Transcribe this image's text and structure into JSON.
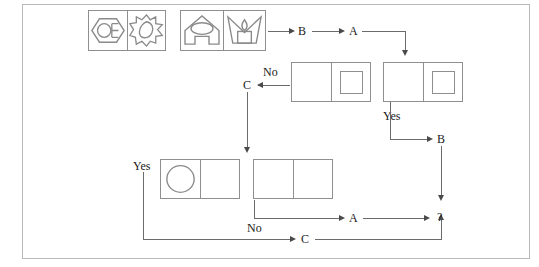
{
  "diagram": {
    "type": "flowchart",
    "title": "",
    "background_color": "#ffffff",
    "frame_color": "#b9b9b9",
    "line_color": "#6b6b6b",
    "shape_stroke_color": "#8a8a8a",
    "stimulus_pairs": [
      {
        "id": "pair-1",
        "left_cell_glyph": "hexagon-with-circle-and-comb-icon",
        "right_cell_glyph": "starburst-with-blob-icon"
      },
      {
        "id": "pair-2",
        "left_cell_glyph": "arch-house-with-ellipse-icon",
        "right_cell_glyph": "crown-with-flame-icon"
      },
      {
        "id": "pair-3",
        "left_cell_glyph": "empty",
        "right_cell_glyph": "square-icon"
      },
      {
        "id": "pair-4",
        "left_cell_glyph": "empty",
        "right_cell_glyph": "square-icon"
      },
      {
        "id": "pair-5",
        "left_cell_glyph": "circle-icon",
        "right_cell_glyph": "empty"
      },
      {
        "id": "pair-6",
        "left_cell_glyph": "empty",
        "right_cell_glyph": "empty"
      }
    ],
    "nodes": [
      {
        "id": "node-b-top",
        "label": "B"
      },
      {
        "id": "node-a-top",
        "label": "A"
      },
      {
        "id": "node-c-mid",
        "label": "C"
      },
      {
        "id": "node-b-right",
        "label": "B"
      },
      {
        "id": "node-a-bottom",
        "label": "A"
      },
      {
        "id": "node-c-bottom",
        "label": "C"
      },
      {
        "id": "node-question",
        "label": "?"
      }
    ],
    "edge_labels": [
      {
        "id": "edge-label-no-mid",
        "label": "No"
      },
      {
        "id": "edge-label-yes-right",
        "label": "Yes"
      },
      {
        "id": "edge-label-yes-left",
        "label": "Yes"
      },
      {
        "id": "edge-label-no-bottom",
        "label": "No"
      }
    ]
  }
}
